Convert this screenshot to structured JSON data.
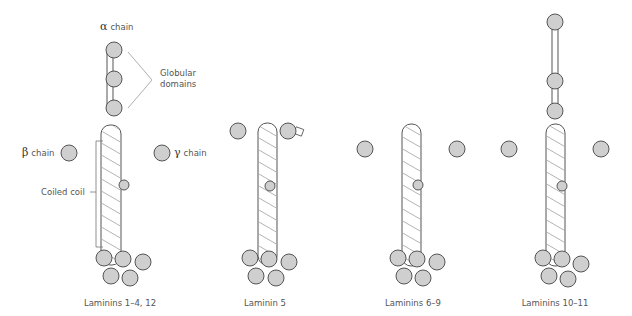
{
  "figure": {
    "type": "laminin structure diagram",
    "colors": {
      "globule_fill": "#cfcfcf",
      "outline": "#555555",
      "background": "#ffffff",
      "text": "#555555"
    },
    "annotations": {
      "alpha": {
        "symbol": "α",
        "text": "chain"
      },
      "beta": {
        "symbol": "β",
        "text": "chain"
      },
      "gamma": {
        "symbol": "γ",
        "text": "chain"
      },
      "globular_line1": "Globular",
      "globular_line2": "domains",
      "coiled_coil": "Coiled coil"
    },
    "structures": [
      {
        "caption": "Laminins 1–4, 12"
      },
      {
        "caption": "Laminin 5"
      },
      {
        "caption": "Laminins 6–9"
      },
      {
        "caption": "Laminins 10–11"
      }
    ]
  }
}
